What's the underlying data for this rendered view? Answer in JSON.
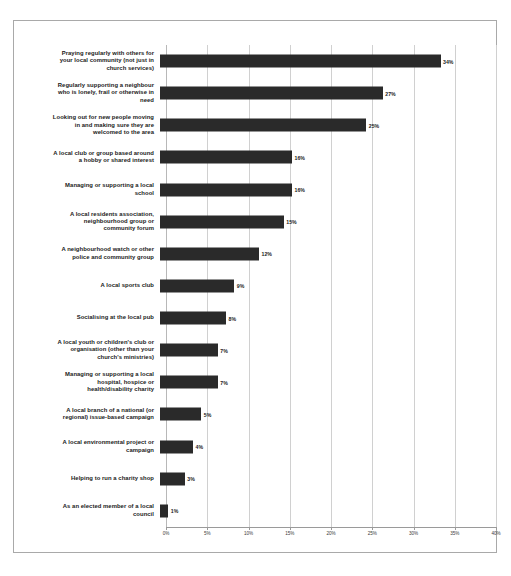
{
  "chart_data": {
    "type": "bar",
    "orientation": "horizontal",
    "title": "",
    "xlabel": "",
    "ylabel": "",
    "xlim": [
      0,
      40
    ],
    "xtick_labels": [
      "0%",
      "5%",
      "10%",
      "15%",
      "20%",
      "25%",
      "30%",
      "35%",
      "40%"
    ],
    "xticks": [
      0,
      5,
      10,
      15,
      20,
      25,
      30,
      35,
      40
    ],
    "grid": true,
    "legend": false,
    "bar_color": "#2a2a2a",
    "value_suffix": "%",
    "categories": [
      "Praying regularly with others for\nyour local community (not just in\nchurch services)",
      "Regularly supporting a neighbour\nwho is lonely, frail or otherwise in\nneed",
      "Looking out for new people moving\nin and making sure they are\nwelcomed to the area",
      "A local club or group based around\na hobby or shared interest",
      "Managing or supporting a local\nschool",
      "A local residents association,\nneighbourhood group or\ncommunity forum",
      "A neighbourhood watch or other\npolice and community group",
      "A local sports club",
      "Socialising at the local pub",
      "A local youth or children's club or\norganisation (other than your\nchurch's ministries)",
      "Managing or supporting a local\nhospital, hospice or\nhealth/disability charity",
      "A local branch of a national (or\nregional) issue-based campaign",
      "A local environmental project or\ncampaign",
      "Helping to run a charity shop",
      "As an elected member of a local\ncouncil"
    ],
    "values": [
      34,
      27,
      25,
      16,
      16,
      15,
      12,
      9,
      8,
      7,
      7,
      5,
      4,
      3,
      1
    ],
    "value_labels": [
      "34%",
      "27%",
      "25%",
      "16%",
      "16%",
      "15%",
      "12%",
      "9%",
      "8%",
      "7%",
      "7%",
      "5%",
      "4%",
      "3%",
      "1%"
    ]
  }
}
